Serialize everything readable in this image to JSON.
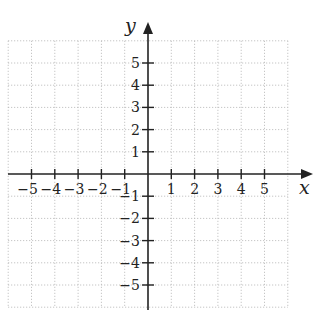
{
  "chart_data": {
    "type": "coordinate-plane",
    "title": "",
    "xlabel": "x",
    "ylabel": "y",
    "xlim": [
      -6,
      6
    ],
    "ylim": [
      -6,
      6
    ],
    "grid": true,
    "grid_style": "dotted",
    "x_ticks": [
      -5,
      -4,
      -3,
      -2,
      -1,
      1,
      2,
      3,
      4,
      5
    ],
    "y_ticks": [
      5,
      4,
      3,
      2,
      1,
      -1,
      -2,
      -3,
      -4,
      -5
    ],
    "x_tick_labels": [
      "−5",
      "−4",
      "−3",
      "−2",
      "−1",
      "1",
      "2",
      "3",
      "4",
      "5"
    ],
    "y_tick_labels": [
      "5",
      "4",
      "3",
      "2",
      "1",
      "−1",
      "−2",
      "−3",
      "−4",
      "−5"
    ],
    "data": []
  },
  "colors": {
    "axis": "#222222",
    "grid": "#b8b8b8",
    "text": "#222222"
  }
}
